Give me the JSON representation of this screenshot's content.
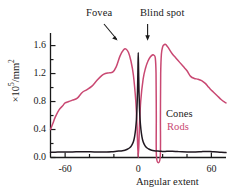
{
  "chart_data": {
    "type": "line",
    "title": "",
    "xlabel": "Angular extent",
    "ylabel": "×10⁵/mm²",
    "xlim": [
      -72,
      72
    ],
    "ylim": [
      0.0,
      1.78
    ],
    "grid": false,
    "legend_position": "right-inside",
    "x_ticks_major": [
      -60,
      0,
      60
    ],
    "x_tick_labels": [
      "-60",
      "0",
      "60"
    ],
    "x_ticks_minor": [
      -40,
      -20,
      20,
      40
    ],
    "y_ticks_major": [
      0.0,
      0.4,
      0.8,
      1.2,
      1.6
    ],
    "y_tick_labels": [
      "0.0",
      "0.4",
      "0.8",
      "1.2",
      "1.6"
    ],
    "y_ticks_minor": [
      0.2,
      0.6,
      1.0,
      1.4
    ],
    "series": [
      {
        "name": "Rods",
        "color": "#c94872",
        "x": [
          -72,
          -70,
          -68,
          -65,
          -62,
          -60,
          -57,
          -54,
          -50,
          -46,
          -42,
          -38,
          -34,
          -30,
          -27,
          -24,
          -21,
          -18,
          -15,
          -12,
          -10,
          -8,
          -6,
          -4,
          -2,
          -1,
          0,
          1,
          2,
          4,
          6,
          8,
          10,
          12,
          13,
          14,
          14.6,
          14.8,
          15,
          18,
          18.2,
          18.4,
          19,
          20,
          21,
          22,
          23,
          25,
          28,
          31,
          34,
          37,
          40,
          43,
          46,
          49,
          52,
          55,
          57,
          59,
          62,
          65,
          68,
          71,
          72
        ],
        "y": [
          0.4,
          0.49,
          0.58,
          0.68,
          0.74,
          0.78,
          0.8,
          0.82,
          0.85,
          0.93,
          0.97,
          1.02,
          1.1,
          1.17,
          1.2,
          1.21,
          1.22,
          1.3,
          1.45,
          1.54,
          1.55,
          1.5,
          1.38,
          1.18,
          0.8,
          0.45,
          0.0,
          0.45,
          0.8,
          1.12,
          1.28,
          1.38,
          1.44,
          1.47,
          1.46,
          1.42,
          1.2,
          0.6,
          0.0,
          0.0,
          0.6,
          1.2,
          1.48,
          1.58,
          1.61,
          1.62,
          1.61,
          1.56,
          1.48,
          1.42,
          1.36,
          1.3,
          1.24,
          1.16,
          1.13,
          1.12,
          1.1,
          1.06,
          1.02,
          0.98,
          0.93,
          0.88,
          0.83,
          0.79,
          0.78
        ]
      },
      {
        "name": "Cones",
        "color": "#201820",
        "x": [
          -72,
          -66,
          -60,
          -54,
          -48,
          -42,
          -36,
          -30,
          -26,
          -22,
          -19,
          -16,
          -13,
          -11,
          -9,
          -7,
          -5.5,
          -4,
          -3,
          -2.2,
          -1.5,
          -1.0,
          -0.6,
          -0.3,
          0,
          0.3,
          0.6,
          1.0,
          1.5,
          2.2,
          3,
          4,
          5.5,
          7,
          9,
          11,
          13,
          16,
          19,
          22,
          25,
          28,
          32,
          36,
          40,
          44,
          47,
          50,
          53,
          56,
          59,
          62,
          65,
          68,
          71,
          72
        ],
        "y": [
          0.075,
          0.077,
          0.079,
          0.08,
          0.081,
          0.081,
          0.08,
          0.079,
          0.08,
          0.083,
          0.087,
          0.092,
          0.098,
          0.105,
          0.118,
          0.14,
          0.17,
          0.225,
          0.3,
          0.4,
          0.54,
          0.73,
          0.95,
          1.22,
          1.5,
          1.22,
          0.95,
          0.73,
          0.54,
          0.4,
          0.3,
          0.225,
          0.17,
          0.14,
          0.118,
          0.105,
          0.098,
          0.092,
          0.088,
          0.086,
          0.09,
          0.088,
          0.085,
          0.082,
          0.08,
          0.079,
          0.08,
          0.082,
          0.085,
          0.087,
          0.086,
          0.082,
          0.078,
          0.074,
          0.071,
          0.07
        ]
      }
    ],
    "annotations": [
      {
        "label": "Fovea",
        "arrow": "diagonal-down-right",
        "points_to_x": 0
      },
      {
        "label": "Blind spot",
        "arrow": "vertical-down",
        "points_to_x": 18
      }
    ],
    "legend_entries": [
      {
        "label": "Cones",
        "color": "#1b1b1b"
      },
      {
        "label": "Rods",
        "color": "#c94872"
      }
    ]
  },
  "axes": {
    "y_label_prefix": "×10",
    "y_label_exponent": "5",
    "y_label_suffix": "/mm",
    "y_label_suffix_exponent": "2",
    "x_label": "Angular extent"
  },
  "ticks": {
    "y": [
      "1.6",
      "1.2",
      "0.8",
      "0.4",
      "0.0"
    ],
    "x": [
      "-60",
      "0",
      "60"
    ]
  },
  "annotations": {
    "fovea": "Fovea",
    "blind_spot": "Blind spot"
  },
  "legend": {
    "cones": "Cones",
    "rods": "Rods"
  },
  "colors": {
    "rods": "#c94872",
    "cones": "#201820",
    "axis": "#1a1a1a",
    "background": "#ffffff"
  }
}
